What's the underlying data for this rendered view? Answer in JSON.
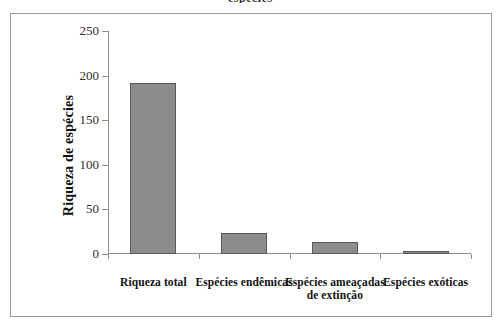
{
  "figure": {
    "caption_fragment": "espécies"
  },
  "chart_data": {
    "type": "bar",
    "title": "",
    "xlabel": "",
    "ylabel": "Riqueza de espécies",
    "categories": [
      "Riqueza total",
      "Espécies endêmicas",
      "Espécies ameaçadas de extinção",
      "Espécies exóticas"
    ],
    "values": [
      192,
      24,
      13,
      3
    ],
    "ylim": [
      0,
      250
    ],
    "yticks": [
      0,
      50,
      100,
      150,
      200,
      250
    ],
    "ytick_labels": [
      "0",
      "50",
      "100",
      "150",
      "200",
      "250"
    ],
    "grid": false,
    "legend": null,
    "bar_color": "#8c8c8c",
    "bar_border_color": "#595959",
    "axis_color": "#8d8d8d"
  }
}
